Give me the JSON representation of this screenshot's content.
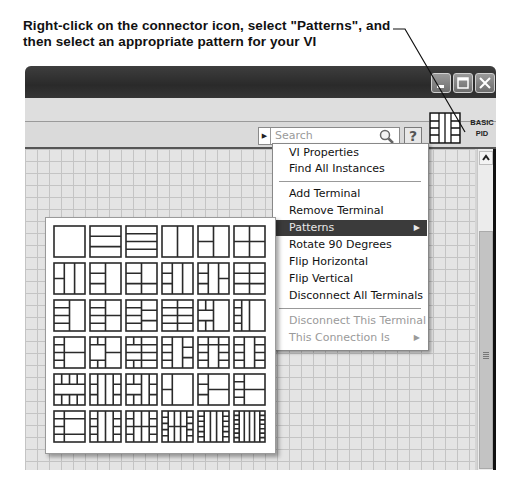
{
  "annotation": {
    "caption_line1": "Right-click on the connector icon, select \"Patterns\", and",
    "caption_line2": "then select an appropriate pattern for your VI"
  },
  "window": {
    "controls": [
      "minimize",
      "maximize",
      "close"
    ]
  },
  "toolbar": {
    "search_placeholder": "Search",
    "search_icon": "magnifier-icon",
    "help_label": "?"
  },
  "vi_icon": {
    "line1": "BASIC",
    "line2": "PID"
  },
  "context_menu": {
    "items": [
      {
        "label": "VI Properties",
        "state": "enabled"
      },
      {
        "label": "Find All Instances",
        "state": "enabled"
      },
      {
        "label": "Add Terminal",
        "state": "enabled"
      },
      {
        "label": "Remove Terminal",
        "state": "enabled"
      },
      {
        "label": "Patterns",
        "state": "highlighted",
        "submenu": true
      },
      {
        "label": "Rotate 90 Degrees",
        "state": "enabled"
      },
      {
        "label": "Flip Horizontal",
        "state": "enabled"
      },
      {
        "label": "Flip Vertical",
        "state": "enabled"
      },
      {
        "label": "Disconnect All Terminals",
        "state": "enabled"
      },
      {
        "label": "Disconnect This Terminal",
        "state": "disabled"
      },
      {
        "label": "This Connection Is",
        "state": "disabled",
        "submenu": true
      }
    ],
    "submenu_arrow": "▶"
  },
  "patterns_palette": {
    "rows": 6,
    "columns": 6,
    "count": 36
  }
}
